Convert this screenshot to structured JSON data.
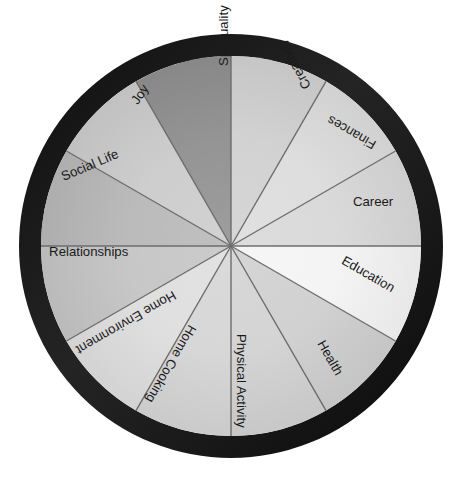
{
  "diagram": {
    "type": "segmented-wheel",
    "center": {
      "x": 231,
      "y": 246
    },
    "radius_inner": 190,
    "radius_outer": 212,
    "ring_color": "#1b1b1b",
    "background_color": "#ffffff",
    "divider_color": "#6d6d6d",
    "label_color": "#1a1a1a",
    "segment_count": 12,
    "segments": [
      {
        "label": "Career",
        "start_angle": -30,
        "end_angle": 0,
        "fill": "#d8d8d8",
        "label_radius": 168,
        "label_angle": -15,
        "label_anchor": "end",
        "text_rotation": 0
      },
      {
        "label": "Education",
        "start_angle": 0,
        "end_angle": 30,
        "fill": "#f4f4f4",
        "label_radius": 168,
        "label_angle": 15,
        "label_anchor": "end",
        "text_rotation": 30
      },
      {
        "label": "Health",
        "start_angle": 30,
        "end_angle": 60,
        "fill": "#cfcfcf",
        "label_radius": 168,
        "label_angle": 50,
        "label_anchor": "end",
        "text_rotation": 60
      },
      {
        "label": "Physical Activity",
        "start_angle": 60,
        "end_angle": 90,
        "fill": "#d2d2d2",
        "label_radius": 182,
        "label_angle": 87,
        "label_anchor": "end",
        "text_rotation": 90
      },
      {
        "label": "Home Cooking",
        "start_angle": 90,
        "end_angle": 120,
        "fill": "#d5d5d5",
        "label_radius": 176,
        "label_angle": 118,
        "label_anchor": "end",
        "text_rotation": 120
      },
      {
        "label": "Home Environment",
        "start_angle": 120,
        "end_angle": 150,
        "fill": "#dedede",
        "label_radius": 186,
        "label_angle": 146,
        "label_anchor": "end",
        "text_rotation": 150
      },
      {
        "label": "Relationships",
        "start_angle": 150,
        "end_angle": 180,
        "fill": "#c4c4c4",
        "label_radius": 182,
        "label_angle": 178,
        "label_anchor": "start",
        "text_rotation": 0
      },
      {
        "label": "Social Life",
        "start_angle": 180,
        "end_angle": 210,
        "fill": "#b7b7b7",
        "label_radius": 182,
        "label_angle": 202,
        "label_anchor": "start",
        "text_rotation": -23
      },
      {
        "label": "Joy",
        "start_angle": 210,
        "end_angle": 240,
        "fill": "#cbcbcb",
        "label_radius": 172,
        "label_angle": 236,
        "label_anchor": "start",
        "text_rotation": -56
      },
      {
        "label": "Spirituality",
        "start_angle": 240,
        "end_angle": 270,
        "fill": "#8f8f8f",
        "label_radius": 180,
        "label_angle": 268,
        "label_anchor": "start",
        "text_rotation": -90
      },
      {
        "label": "Creativity",
        "start_angle": 270,
        "end_angle": 300,
        "fill": "#d0d0d0",
        "label_radius": 176,
        "label_angle": 296,
        "label_anchor": "start",
        "text_rotation": -120
      },
      {
        "label": "Finances",
        "start_angle": 300,
        "end_angle": 330,
        "fill": "#dcdcdc",
        "label_radius": 176,
        "label_angle": 325,
        "label_anchor": "start",
        "text_rotation": -150
      }
    ]
  }
}
